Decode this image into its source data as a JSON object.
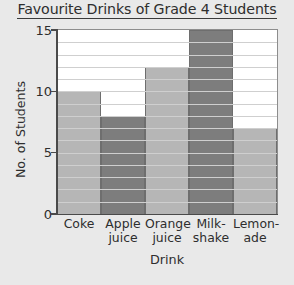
{
  "chart_data": {
    "type": "bar",
    "title": "Favourite Drinks of Grade 4 Students",
    "xlabel": "Drink",
    "ylabel": "No. of Students",
    "categories": [
      "Coke",
      "Apple juice",
      "Orange juice",
      "Milk-shake",
      "Lemon-ade"
    ],
    "category_lines": [
      [
        "Coke",
        ""
      ],
      [
        "Apple",
        "juice"
      ],
      [
        "Orange",
        "juice"
      ],
      [
        "Milk-",
        "shake"
      ],
      [
        "Lemon-",
        "ade"
      ]
    ],
    "values": [
      10,
      8,
      12,
      15,
      7
    ],
    "ylim": [
      0,
      15
    ],
    "ytick_labels": [
      "0",
      "5",
      "10",
      "15"
    ],
    "ytick_values": [
      0,
      5,
      10,
      15
    ],
    "grid": true,
    "grid_step": 1,
    "legend": "none",
    "bar_colors": [
      "#b6b6b6",
      "#7d7d7d",
      "#b6b6b6",
      "#7d7d7d",
      "#b6b6b6"
    ],
    "colors": {
      "background": "#e9e9e9",
      "plot_background": "#ffffff",
      "gridline": "#cfcfcf",
      "axis": "#4a4a4a",
      "bar_light": "#b6b6b6",
      "bar_dark": "#7d7d7d",
      "bar_border": "#6e6e6e",
      "text": "#2e2e2e"
    }
  }
}
